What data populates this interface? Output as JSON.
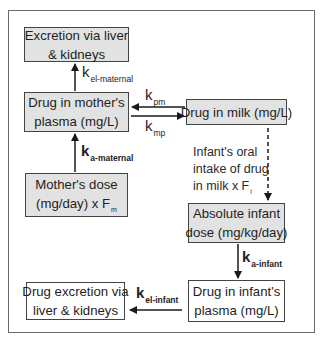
{
  "diagram": {
    "boxes": {
      "maternal_excretion": {
        "lines": [
          "Excretion via liver",
          "& kidneys"
        ]
      },
      "maternal_plasma": {
        "lines": [
          "Drug in mother's",
          "plasma (mg/L)"
        ]
      },
      "maternal_dose": {
        "line1": "Mother's dose",
        "line2_main": "(mg/day) x F",
        "line2_sub": "m"
      },
      "milk": {
        "lines": [
          "Drug in milk (mg/L)"
        ]
      },
      "infant_dose": {
        "lines": [
          "Absolute infant",
          "dose (mg/kg/day)"
        ]
      },
      "infant_plasma": {
        "lines": [
          "Drug in infant's",
          "plasma (mg/L)"
        ]
      },
      "infant_excretion": {
        "lines": [
          "Drug excretion via",
          "liver & kidneys"
        ]
      }
    },
    "rate_labels": {
      "k_el_maternal": {
        "k": "k",
        "sub": "el-maternal"
      },
      "k_a_maternal": {
        "k": "k",
        "sub": "a-maternal"
      },
      "k_pm": {
        "k": "k",
        "sub": "pm"
      },
      "k_mp": {
        "k": "k",
        "sub": "mp"
      },
      "k_a_infant": {
        "k": "k",
        "sub": "a-infant"
      },
      "k_el_infant": {
        "k": "k",
        "sub": "el-infant"
      }
    },
    "oral_intake_note": {
      "line1": "Infant's oral",
      "line2": "intake of drug",
      "line3_main": "in milk x F",
      "line3_sub": "i"
    },
    "edges": [
      {
        "from": "maternal_plasma",
        "to": "maternal_excretion",
        "label": "k_el_maternal",
        "style": "solid"
      },
      {
        "from": "maternal_dose",
        "to": "maternal_plasma",
        "label": "k_a_maternal",
        "style": "solid"
      },
      {
        "from": "maternal_plasma",
        "to": "milk",
        "label": "k_mp",
        "style": "solid"
      },
      {
        "from": "milk",
        "to": "maternal_plasma",
        "label": "k_pm",
        "style": "solid"
      },
      {
        "from": "milk",
        "to": "infant_dose",
        "label": "oral_intake_note",
        "style": "dashed"
      },
      {
        "from": "infant_dose",
        "to": "infant_plasma",
        "label": "k_a_infant",
        "style": "solid"
      },
      {
        "from": "infant_plasma",
        "to": "infant_excretion",
        "label": "k_el_infant",
        "style": "solid"
      }
    ],
    "colors": {
      "box_fill_grey": "#e2e2e2",
      "box_fill_white": "#ffffff",
      "stroke": "#222222"
    }
  }
}
